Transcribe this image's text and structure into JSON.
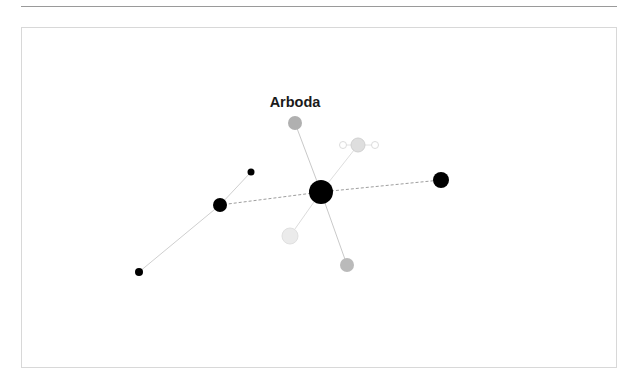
{
  "page": {
    "background_color": "#ffffff",
    "width": 638,
    "height": 386
  },
  "top_rule": {
    "color": "#9a9a9a"
  },
  "panel": {
    "border_color": "#d8d8d8",
    "background_color": "#ffffff"
  },
  "chart_data": {
    "type": "scatter",
    "subtype": "node-link-network",
    "title": "Arboda",
    "xlabel": "",
    "ylabel": "",
    "grid": false,
    "legend": "none",
    "axis_visible": false,
    "xlim": [
      21,
      617
    ],
    "ylim": [
      27,
      368
    ],
    "label_annotation": {
      "text": "Arboda",
      "x": 295,
      "y": 107,
      "color": "#1a1a1a",
      "bold": true,
      "font_size": 14.5
    },
    "nodes": [
      {
        "id": "hub",
        "name": "Arboda",
        "x": 321,
        "y": 192,
        "r": 12,
        "fill": "#000000",
        "stroke": "none",
        "style": "filled"
      },
      {
        "id": "gray-top",
        "name": "gray-node-top",
        "x": 295,
        "y": 123,
        "r": 7,
        "fill": "#b0b0b0",
        "stroke": "none",
        "style": "filled"
      },
      {
        "id": "lightgray-cluster-hub",
        "name": "light-gray-cluster-hub",
        "x": 358,
        "y": 145,
        "r": 7,
        "fill": "#dedede",
        "stroke": "#d0d0d0",
        "style": "filled"
      },
      {
        "id": "hollow-left",
        "name": "hollow-node-left",
        "x": 343,
        "y": 145,
        "r": 3.5,
        "fill": "#ffffff",
        "stroke": "#dcdcdc",
        "style": "hollow"
      },
      {
        "id": "hollow-right",
        "name": "hollow-node-right",
        "x": 375,
        "y": 145,
        "r": 3.5,
        "fill": "#ffffff",
        "stroke": "#dcdcdc",
        "style": "hollow"
      },
      {
        "id": "black-mid-left",
        "name": "black-node-mid-left",
        "x": 220,
        "y": 205,
        "r": 7,
        "fill": "#000000",
        "stroke": "none",
        "style": "filled"
      },
      {
        "id": "black-small-upper-left",
        "name": "black-node-small-upper-left",
        "x": 251,
        "y": 172,
        "r": 3.5,
        "fill": "#000000",
        "stroke": "none",
        "style": "filled"
      },
      {
        "id": "black-small-lower-left",
        "name": "black-node-small-lower-left",
        "x": 139,
        "y": 272,
        "r": 4,
        "fill": "#000000",
        "stroke": "none",
        "style": "filled"
      },
      {
        "id": "black-right",
        "name": "black-node-right",
        "x": 441,
        "y": 180,
        "r": 8,
        "fill": "#000000",
        "stroke": "none",
        "style": "filled"
      },
      {
        "id": "verylight-lower",
        "name": "very-light-gray-node-lower",
        "x": 290,
        "y": 236,
        "r": 8,
        "fill": "#ebebeb",
        "stroke": "#e0e0e0",
        "style": "filled"
      },
      {
        "id": "gray-bottom",
        "name": "gray-node-bottom",
        "x": 347,
        "y": 265,
        "r": 7,
        "fill": "#bababa",
        "stroke": "none",
        "style": "filled"
      }
    ],
    "edges": [
      {
        "source": "hub",
        "target": "gray-top",
        "style": "solid",
        "color": "#c9c9c9",
        "width": 1
      },
      {
        "source": "hub",
        "target": "lightgray-cluster-hub",
        "style": "solid",
        "color": "#dedede",
        "width": 1
      },
      {
        "source": "lightgray-cluster-hub",
        "target": "hollow-left",
        "style": "solid",
        "color": "#e2e2e2",
        "width": 1
      },
      {
        "source": "lightgray-cluster-hub",
        "target": "hollow-right",
        "style": "solid",
        "color": "#e2e2e2",
        "width": 1
      },
      {
        "source": "hub",
        "target": "verylight-lower",
        "style": "solid",
        "color": "#dcdcdc",
        "width": 1
      },
      {
        "source": "hub",
        "target": "gray-bottom",
        "style": "solid",
        "color": "#c9c9c9",
        "width": 1
      },
      {
        "source": "hub",
        "target": "black-right",
        "style": "dashed",
        "color": "#9e9e9e",
        "width": 1
      },
      {
        "source": "hub",
        "target": "black-mid-left",
        "style": "dashed",
        "color": "#9e9e9e",
        "width": 1
      },
      {
        "source": "black-mid-left",
        "target": "black-small-upper-left",
        "style": "solid",
        "color": "#cfcfcf",
        "width": 1
      },
      {
        "source": "black-mid-left",
        "target": "black-small-lower-left",
        "style": "solid",
        "color": "#cfcfcf",
        "width": 1
      }
    ]
  }
}
